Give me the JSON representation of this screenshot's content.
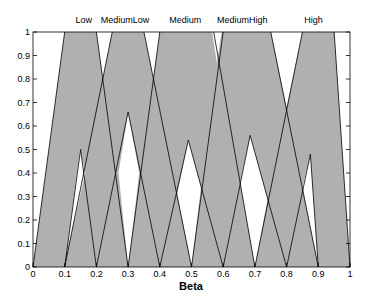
{
  "chart_data": {
    "type": "area",
    "title": "",
    "xlabel": "Beta",
    "ylabel": "",
    "xlim": [
      0,
      1
    ],
    "ylim": [
      0,
      1
    ],
    "grid": false,
    "xticks": [
      "0",
      "0.1",
      "0.2",
      "0.3",
      "0.4",
      "0.5",
      "0.6",
      "0.7",
      "0.8",
      "0.9",
      "1"
    ],
    "yticks": [
      "0",
      "0.1",
      "0.2",
      "0.3",
      "0.4",
      "0.5",
      "0.6",
      "0.7",
      "0.8",
      "0.9",
      "1"
    ],
    "fill_color": "#b0b0b0",
    "line_color": "#000000",
    "membership_functions": [
      {
        "name": "Low",
        "label_x": 0.16,
        "upper": [
          0,
          0.1,
          0.2,
          0.3
        ],
        "lower": [
          0.1,
          0.15,
          0.2,
          0.5
        ]
      },
      {
        "name": "MediumLow",
        "label_x": 0.29,
        "upper": [
          0.1,
          0.25,
          0.35,
          0.5
        ],
        "lower": [
          0.27,
          0.3,
          0.335,
          0.66
        ]
      },
      {
        "name": "Medium",
        "label_x": 0.48,
        "upper": [
          0.3,
          0.4,
          0.57,
          0.7
        ],
        "lower": [
          0.455,
          0.49,
          0.53,
          0.54
        ]
      },
      {
        "name": "MediumHigh",
        "label_x": 0.66,
        "upper": [
          0.5,
          0.6,
          0.75,
          0.9
        ],
        "lower": [
          0.653,
          0.685,
          0.74,
          0.56
        ]
      },
      {
        "name": "High",
        "label_x": 0.885,
        "upper": [
          0.7,
          0.85,
          0.95,
          1.0
        ],
        "lower": [
          0.85,
          0.875,
          0.9,
          0.48
        ]
      }
    ],
    "white_regions": [
      [
        [
          0,
          0
        ],
        [
          0,
          1
        ],
        [
          0.1,
          1
        ]
      ],
      [
        [
          0.2,
          1
        ],
        [
          0.25,
          1
        ],
        [
          0.22,
          0.8
        ]
      ],
      [
        [
          0.35,
          1
        ],
        [
          0.4,
          1
        ],
        [
          0.38,
          0.8
        ]
      ],
      [
        [
          0.565,
          1
        ],
        [
          0.595,
          1
        ],
        [
          0.58,
          0.87
        ]
      ],
      [
        [
          0.75,
          1
        ],
        [
          0.85,
          1
        ],
        [
          0.8,
          0.68
        ]
      ],
      [
        [
          0.95,
          1
        ],
        [
          1,
          1
        ],
        [
          1,
          0
        ]
      ],
      [
        [
          0.148,
          0.5
        ],
        [
          0.165,
          0.4
        ],
        [
          0.105,
          0.05
        ]
      ],
      [
        [
          0.3,
          0.66
        ],
        [
          0.27,
          0.4
        ],
        [
          0.3,
          0
        ],
        [
          0.335,
          0.4
        ]
      ],
      [
        [
          0.49,
          0.54
        ],
        [
          0.455,
          0.31
        ],
        [
          0.5,
          0
        ],
        [
          0.53,
          0.34
        ]
      ],
      [
        [
          0.685,
          0.56
        ],
        [
          0.653,
          0.36
        ],
        [
          0.7,
          0
        ],
        [
          0.74,
          0.29
        ]
      ],
      [
        [
          0.875,
          0.48
        ],
        [
          0.85,
          0.34
        ],
        [
          0.9,
          0
        ]
      ]
    ],
    "edges": [
      [
        [
          0,
          0
        ],
        [
          0.1,
          1
        ]
      ],
      [
        [
          0.2,
          1
        ],
        [
          0.3,
          0
        ]
      ],
      [
        [
          0.1,
          0
        ],
        [
          0.15,
          0.5
        ]
      ],
      [
        [
          0.15,
          0.5
        ],
        [
          0.2,
          0
        ]
      ],
      [
        [
          0.1,
          0
        ],
        [
          0.25,
          1
        ]
      ],
      [
        [
          0.35,
          1
        ],
        [
          0.5,
          0
        ]
      ],
      [
        [
          0.2,
          0
        ],
        [
          0.3,
          0.66
        ]
      ],
      [
        [
          0.3,
          0.66
        ],
        [
          0.4,
          0
        ]
      ],
      [
        [
          0.3,
          0
        ],
        [
          0.4,
          1
        ]
      ],
      [
        [
          0.57,
          1
        ],
        [
          0.7,
          0
        ]
      ],
      [
        [
          0.4,
          0
        ],
        [
          0.49,
          0.54
        ]
      ],
      [
        [
          0.49,
          0.54
        ],
        [
          0.6,
          0
        ]
      ],
      [
        [
          0.5,
          0
        ],
        [
          0.6,
          1
        ]
      ],
      [
        [
          0.75,
          1
        ],
        [
          0.9,
          0
        ]
      ],
      [
        [
          0.6,
          0
        ],
        [
          0.685,
          0.56
        ]
      ],
      [
        [
          0.685,
          0.56
        ],
        [
          0.8,
          0
        ]
      ],
      [
        [
          0.7,
          0
        ],
        [
          0.85,
          1
        ]
      ],
      [
        [
          0.95,
          1
        ],
        [
          1,
          0
        ]
      ],
      [
        [
          0.8,
          0
        ],
        [
          0.875,
          0.48
        ]
      ],
      [
        [
          0.875,
          0.48
        ],
        [
          0.9,
          0
        ]
      ]
    ]
  }
}
